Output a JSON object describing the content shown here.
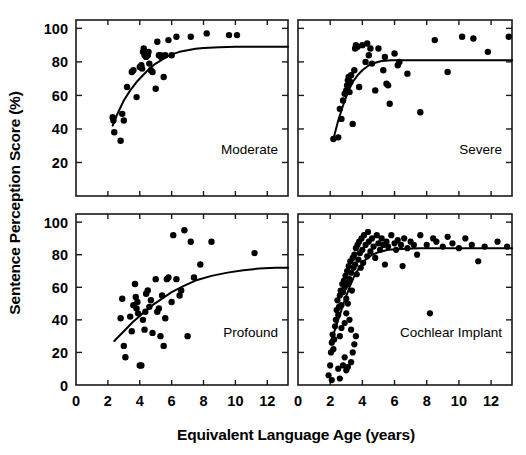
{
  "chart_data": {
    "type": "scatter",
    "title": "",
    "xlabel": "Equivalent Language Age (years)",
    "ylabel": "Sentence Perception Score (%)",
    "xlim": [
      0,
      13.3
    ],
    "ylim": [
      0,
      105
    ],
    "xticks": [
      0,
      2,
      4,
      6,
      8,
      10,
      12
    ],
    "xticklabels": [
      "0",
      "2",
      "4",
      "6",
      "8",
      "10",
      "12"
    ],
    "grid": false,
    "legend_position": "none",
    "layout": "2x2 grid of panels sharing x and y axes",
    "panels": [
      {
        "id": "moderate",
        "label": "Moderate",
        "row": 0,
        "col": 0,
        "yticks": [
          20,
          40,
          60,
          80,
          100
        ],
        "yticklabels": [
          "20",
          "40",
          "60",
          "80",
          "100"
        ],
        "fit_curve": {
          "description": "rising saturating curve, asymptote near 89%",
          "x": [
            2.3,
            2.6,
            3.0,
            3.4,
            3.8,
            4.2,
            4.6,
            5.0,
            5.5,
            6.0,
            6.5,
            7.0,
            7.5,
            8.0,
            9.0,
            10.0,
            11.0,
            12.0,
            13.3
          ],
          "y": [
            42,
            49,
            57,
            63,
            68,
            72,
            76,
            79,
            82,
            84.5,
            86,
            87,
            87.8,
            88.3,
            88.8,
            89,
            89,
            89,
            89
          ]
        },
        "points": [
          [
            2.3,
            47
          ],
          [
            2.35,
            45
          ],
          [
            2.4,
            38
          ],
          [
            2.8,
            33
          ],
          [
            2.9,
            49
          ],
          [
            3.0,
            45
          ],
          [
            3.2,
            65
          ],
          [
            3.5,
            74
          ],
          [
            3.6,
            75
          ],
          [
            3.8,
            59
          ],
          [
            4.0,
            77
          ],
          [
            4.1,
            78
          ],
          [
            4.15,
            76
          ],
          [
            4.2,
            86
          ],
          [
            4.25,
            88
          ],
          [
            4.3,
            84
          ],
          [
            4.35,
            85
          ],
          [
            4.4,
            83
          ],
          [
            4.45,
            85
          ],
          [
            4.5,
            84
          ],
          [
            4.55,
            86
          ],
          [
            4.6,
            79
          ],
          [
            4.7,
            75
          ],
          [
            4.8,
            74
          ],
          [
            5.0,
            64
          ],
          [
            5.1,
            92
          ],
          [
            5.2,
            84
          ],
          [
            5.3,
            84
          ],
          [
            5.35,
            83
          ],
          [
            5.5,
            71
          ],
          [
            5.6,
            84
          ],
          [
            5.8,
            93
          ],
          [
            6.0,
            84
          ],
          [
            6.3,
            95
          ],
          [
            7.2,
            95
          ],
          [
            8.2,
            97
          ],
          [
            9.6,
            96
          ],
          [
            10.1,
            96
          ]
        ]
      },
      {
        "id": "severe",
        "label": "Severe",
        "row": 0,
        "col": 1,
        "yticks": [
          20,
          40,
          60,
          80,
          100
        ],
        "yticklabels": [
          "20",
          "40",
          "60",
          "80",
          "100"
        ],
        "fit_curve": {
          "description": "rising saturating curve, asymptote near 81%",
          "x": [
            2.2,
            2.5,
            2.8,
            3.1,
            3.4,
            3.7,
            4.0,
            4.4,
            4.8,
            5.2,
            5.8,
            6.5,
            7.5,
            9.0,
            11.0,
            13.3
          ],
          "y": [
            34,
            45,
            54,
            62,
            68,
            72,
            75,
            78,
            79.5,
            80.5,
            81,
            81,
            81,
            81,
            81,
            81
          ]
        },
        "points": [
          [
            2.2,
            34
          ],
          [
            2.5,
            35
          ],
          [
            2.6,
            52
          ],
          [
            2.7,
            46
          ],
          [
            2.8,
            57
          ],
          [
            2.9,
            61
          ],
          [
            3.0,
            63
          ],
          [
            3.05,
            66
          ],
          [
            3.1,
            69
          ],
          [
            3.15,
            71
          ],
          [
            3.2,
            62
          ],
          [
            3.25,
            68
          ],
          [
            3.3,
            72
          ],
          [
            3.4,
            43
          ],
          [
            3.5,
            75
          ],
          [
            3.55,
            88
          ],
          [
            3.6,
            90
          ],
          [
            3.7,
            89
          ],
          [
            3.8,
            65
          ],
          [
            4.0,
            90
          ],
          [
            4.2,
            80
          ],
          [
            4.3,
            91
          ],
          [
            4.4,
            84
          ],
          [
            4.5,
            88
          ],
          [
            4.6,
            79
          ],
          [
            4.8,
            63
          ],
          [
            5.0,
            88
          ],
          [
            5.3,
            75
          ],
          [
            5.4,
            83
          ],
          [
            5.5,
            67
          ],
          [
            5.6,
            66
          ],
          [
            5.7,
            55
          ],
          [
            6.0,
            85
          ],
          [
            6.2,
            78
          ],
          [
            6.3,
            80
          ],
          [
            6.8,
            73
          ],
          [
            7.6,
            50
          ],
          [
            8.5,
            93
          ],
          [
            9.3,
            74
          ],
          [
            10.2,
            95
          ],
          [
            10.9,
            94
          ],
          [
            11.8,
            86
          ],
          [
            13.1,
            95
          ]
        ]
      },
      {
        "id": "profound",
        "label": "Profound",
        "row": 1,
        "col": 0,
        "yticks": [
          0,
          20,
          40,
          60,
          80,
          100
        ],
        "yticklabels": [
          "0",
          "20",
          "40",
          "60",
          "80",
          "100"
        ],
        "fit_curve": {
          "description": "gradually rising curve, reaching about 72% at age 13",
          "x": [
            2.4,
            3.0,
            3.6,
            4.2,
            4.8,
            5.4,
            6.0,
            6.8,
            7.6,
            8.5,
            9.5,
            10.5,
            11.5,
            12.5,
            13.3
          ],
          "y": [
            27,
            33,
            39,
            44,
            49,
            53,
            57,
            61,
            64.5,
            67,
            69,
            70.5,
            71.5,
            72,
            72
          ]
        },
        "points": [
          [
            2.8,
            41
          ],
          [
            2.9,
            53
          ],
          [
            3.0,
            24
          ],
          [
            3.1,
            17
          ],
          [
            3.4,
            42
          ],
          [
            3.5,
            33
          ],
          [
            3.6,
            49
          ],
          [
            3.7,
            62
          ],
          [
            3.75,
            54
          ],
          [
            3.8,
            47
          ],
          [
            3.85,
            51
          ],
          [
            3.9,
            44
          ],
          [
            4.0,
            12
          ],
          [
            4.1,
            12
          ],
          [
            4.2,
            40
          ],
          [
            4.3,
            34
          ],
          [
            4.35,
            45
          ],
          [
            4.4,
            56
          ],
          [
            4.5,
            58
          ],
          [
            4.6,
            48
          ],
          [
            4.7,
            52
          ],
          [
            4.8,
            32
          ],
          [
            5.0,
            65
          ],
          [
            5.1,
            45
          ],
          [
            5.2,
            47
          ],
          [
            5.3,
            30
          ],
          [
            5.4,
            55
          ],
          [
            5.5,
            24
          ],
          [
            5.6,
            41
          ],
          [
            5.7,
            65
          ],
          [
            5.8,
            66
          ],
          [
            6.0,
            51
          ],
          [
            6.1,
            92
          ],
          [
            6.3,
            65
          ],
          [
            6.5,
            55
          ],
          [
            6.6,
            58
          ],
          [
            6.8,
            95
          ],
          [
            7.0,
            30
          ],
          [
            7.2,
            88
          ],
          [
            7.4,
            66
          ],
          [
            7.8,
            74
          ],
          [
            8.5,
            88
          ],
          [
            11.2,
            81
          ]
        ]
      },
      {
        "id": "cochlear-implant",
        "label": "Cochlear Implant",
        "row": 1,
        "col": 1,
        "yticks": [
          0,
          20,
          40,
          60,
          80,
          100
        ],
        "yticklabels": [
          "0",
          "20",
          "40",
          "60",
          "80",
          "100"
        ],
        "fit_curve": {
          "description": "steeply rising then flat curve, asymptote near 84%",
          "x": [
            2.0,
            2.3,
            2.6,
            2.9,
            3.2,
            3.5,
            3.8,
            4.2,
            4.6,
            5.0,
            5.6,
            6.4,
            7.5,
            9.0,
            11.0,
            13.3
          ],
          "y": [
            26,
            34,
            43,
            52,
            60,
            67,
            72,
            77,
            80,
            81.5,
            83,
            83.5,
            84,
            84,
            84,
            84
          ]
        },
        "points": [
          [
            1.9,
            6
          ],
          [
            2.0,
            12
          ],
          [
            2.05,
            20
          ],
          [
            2.1,
            26
          ],
          [
            2.15,
            31
          ],
          [
            2.2,
            22
          ],
          [
            2.25,
            28
          ],
          [
            2.3,
            36
          ],
          [
            2.35,
            40
          ],
          [
            2.4,
            46
          ],
          [
            2.45,
            52
          ],
          [
            2.5,
            43
          ],
          [
            2.55,
            48
          ],
          [
            2.6,
            55
          ],
          [
            2.65,
            58
          ],
          [
            2.7,
            49
          ],
          [
            2.75,
            62
          ],
          [
            2.8,
            57
          ],
          [
            2.85,
            64
          ],
          [
            2.9,
            60
          ],
          [
            2.95,
            67
          ],
          [
            3.0,
            53
          ],
          [
            3.05,
            70
          ],
          [
            3.1,
            62
          ],
          [
            3.15,
            73
          ],
          [
            3.2,
            65
          ],
          [
            3.25,
            76
          ],
          [
            3.3,
            69
          ],
          [
            3.35,
            58
          ],
          [
            3.4,
            78
          ],
          [
            3.45,
            72
          ],
          [
            3.5,
            80
          ],
          [
            3.55,
            74
          ],
          [
            3.6,
            84
          ],
          [
            3.65,
            68
          ],
          [
            3.7,
            86
          ],
          [
            3.75,
            77
          ],
          [
            3.8,
            88
          ],
          [
            3.85,
            81
          ],
          [
            3.9,
            72
          ],
          [
            3.95,
            90
          ],
          [
            4.0,
            83
          ],
          [
            4.05,
            75
          ],
          [
            4.1,
            92
          ],
          [
            4.2,
            86
          ],
          [
            4.3,
            79
          ],
          [
            4.35,
            94
          ],
          [
            4.4,
            88
          ],
          [
            4.5,
            82
          ],
          [
            4.6,
            90
          ],
          [
            4.7,
            85
          ],
          [
            4.8,
            78
          ],
          [
            4.9,
            92
          ],
          [
            5.0,
            87
          ],
          [
            5.1,
            83
          ],
          [
            5.2,
            90
          ],
          [
            5.3,
            86
          ],
          [
            5.4,
            74
          ],
          [
            5.5,
            88
          ],
          [
            5.6,
            85
          ],
          [
            5.8,
            92
          ],
          [
            6.0,
            87
          ],
          [
            6.1,
            83
          ],
          [
            6.2,
            89
          ],
          [
            6.4,
            86
          ],
          [
            6.5,
            73
          ],
          [
            6.6,
            90
          ],
          [
            6.8,
            84
          ],
          [
            7.0,
            88
          ],
          [
            7.2,
            86
          ],
          [
            7.4,
            80
          ],
          [
            7.6,
            92
          ],
          [
            8.0,
            86
          ],
          [
            8.2,
            44
          ],
          [
            8.4,
            90
          ],
          [
            8.6,
            88
          ],
          [
            9.0,
            85
          ],
          [
            9.3,
            91
          ],
          [
            9.6,
            87
          ],
          [
            10.0,
            84
          ],
          [
            10.4,
            90
          ],
          [
            10.8,
            86
          ],
          [
            11.2,
            76
          ],
          [
            11.6,
            85
          ],
          [
            12.4,
            88
          ],
          [
            13.0,
            85
          ],
          [
            2.1,
            3
          ],
          [
            2.5,
            10
          ],
          [
            2.6,
            4
          ],
          [
            3.0,
            9
          ],
          [
            3.1,
            11
          ],
          [
            3.3,
            14
          ],
          [
            2.8,
            12
          ],
          [
            2.9,
            17
          ],
          [
            3.4,
            20
          ],
          [
            3.5,
            25
          ],
          [
            3.6,
            30
          ],
          [
            3.3,
            34
          ],
          [
            3.2,
            40
          ],
          [
            2.7,
            35
          ],
          [
            2.6,
            30
          ],
          [
            2.9,
            38
          ],
          [
            3.0,
            44
          ],
          [
            3.1,
            50
          ]
        ]
      }
    ]
  },
  "axis": {
    "ylabel": "Sentence Perception Score (%)",
    "xlabel": "Equivalent Language Age (years)"
  },
  "style": {
    "ink": "#1a1a1a",
    "point_color": "#000000",
    "curve_color": "#000000",
    "background": "#ffffff"
  }
}
